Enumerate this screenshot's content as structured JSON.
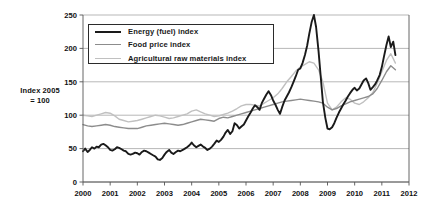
{
  "chart_data": {
    "type": "line",
    "title": "",
    "subtitle": "",
    "xlabel": "",
    "ylabel": "Index 2005 = 100",
    "ylabel_line1": "Index 2005",
    "ylabel_line2": "= 100",
    "xlim": [
      2000,
      2012
    ],
    "ylim": [
      0,
      250
    ],
    "yticks": [
      0,
      50,
      100,
      150,
      200,
      250
    ],
    "ytick_labels": [
      "0",
      "50",
      "100",
      "150",
      "200",
      "250"
    ],
    "xticks": [
      2000,
      2001,
      2002,
      2003,
      2004,
      2005,
      2006,
      2007,
      2008,
      2009,
      2010,
      2011,
      2012
    ],
    "xtick_labels": [
      "2000",
      "2001",
      "2002",
      "2003",
      "2004",
      "2005",
      "2006",
      "2007",
      "2008",
      "2009",
      "2010",
      "2011",
      "2012"
    ],
    "grid": "horizontal",
    "legend_position": "upper-left-inside",
    "colors": {
      "energy": "#1a1a1a",
      "food": "#8c8c8c",
      "agricultural": "#c0c0c0",
      "gridline": "#9a9a9a",
      "axis": "#555555",
      "background": "#ffffff"
    },
    "series": [
      {
        "name": "Energy (fuel) index",
        "color": "#1a1a1a",
        "width": 1.9,
        "x": [
          2000.0,
          2000.08,
          2000.17,
          2000.25,
          2000.33,
          2000.42,
          2000.5,
          2000.58,
          2000.67,
          2000.75,
          2000.83,
          2000.92,
          2001.0,
          2001.08,
          2001.17,
          2001.25,
          2001.33,
          2001.42,
          2001.5,
          2001.58,
          2001.67,
          2001.75,
          2001.83,
          2001.92,
          2002.0,
          2002.08,
          2002.17,
          2002.25,
          2002.33,
          2002.42,
          2002.5,
          2002.58,
          2002.67,
          2002.75,
          2002.83,
          2002.92,
          2003.0,
          2003.08,
          2003.17,
          2003.25,
          2003.33,
          2003.42,
          2003.5,
          2003.58,
          2003.67,
          2003.75,
          2003.83,
          2003.92,
          2004.0,
          2004.08,
          2004.17,
          2004.25,
          2004.33,
          2004.42,
          2004.5,
          2004.58,
          2004.67,
          2004.75,
          2004.83,
          2004.92,
          2005.0,
          2005.08,
          2005.17,
          2005.25,
          2005.33,
          2005.42,
          2005.5,
          2005.58,
          2005.67,
          2005.75,
          2005.83,
          2005.92,
          2006.0,
          2006.08,
          2006.17,
          2006.25,
          2006.33,
          2006.42,
          2006.5,
          2006.58,
          2006.67,
          2006.75,
          2006.83,
          2006.92,
          2007.0,
          2007.08,
          2007.17,
          2007.25,
          2007.33,
          2007.42,
          2007.5,
          2007.58,
          2007.67,
          2007.75,
          2007.83,
          2007.92,
          2008.0,
          2008.08,
          2008.17,
          2008.25,
          2008.33,
          2008.42,
          2008.5,
          2008.58,
          2008.67,
          2008.75,
          2008.83,
          2008.92,
          2009.0,
          2009.08,
          2009.17,
          2009.25,
          2009.33,
          2009.42,
          2009.5,
          2009.58,
          2009.67,
          2009.75,
          2009.83,
          2009.92,
          2010.0,
          2010.08,
          2010.17,
          2010.25,
          2010.33,
          2010.42,
          2010.5,
          2010.58,
          2010.67,
          2010.75,
          2010.83,
          2010.92,
          2011.0,
          2011.08,
          2011.17,
          2011.25,
          2011.33,
          2011.42,
          2011.5
        ],
        "values": [
          46,
          50,
          45,
          48,
          52,
          50,
          53,
          52,
          56,
          57,
          55,
          52,
          48,
          47,
          49,
          52,
          51,
          49,
          47,
          46,
          42,
          41,
          42,
          44,
          43,
          41,
          45,
          47,
          46,
          44,
          42,
          40,
          38,
          34,
          33,
          36,
          41,
          45,
          48,
          44,
          42,
          45,
          47,
          46,
          48,
          50,
          52,
          55,
          59,
          55,
          52,
          54,
          56,
          53,
          51,
          48,
          50,
          53,
          57,
          62,
          60,
          63,
          68,
          74,
          78,
          72,
          76,
          88,
          85,
          80,
          83,
          86,
          92,
          98,
          104,
          110,
          115,
          112,
          108,
          118,
          125,
          131,
          136,
          130,
          122,
          116,
          108,
          102,
          112,
          122,
          128,
          134,
          142,
          150,
          158,
          168,
          170,
          178,
          190,
          204,
          222,
          240,
          250,
          232,
          196,
          158,
          120,
          96,
          80,
          79,
          82,
          88,
          96,
          104,
          110,
          116,
          122,
          128,
          133,
          138,
          141,
          137,
          140,
          146,
          152,
          155,
          148,
          138,
          142,
          146,
          152,
          160,
          172,
          188,
          205,
          218,
          202,
          210,
          190
        ],
        "peak_value": 250,
        "peak_year": "mid-2008",
        "trough_value": 33,
        "trough_year": "late-2001",
        "end_value": 190
      },
      {
        "name": "Food price index",
        "color": "#8c8c8c",
        "width": 1.4,
        "x": [
          2000.0,
          2000.17,
          2000.33,
          2000.5,
          2000.67,
          2000.83,
          2001.0,
          2001.17,
          2001.33,
          2001.5,
          2001.67,
          2001.83,
          2002.0,
          2002.17,
          2002.33,
          2002.5,
          2002.67,
          2002.83,
          2003.0,
          2003.17,
          2003.33,
          2003.5,
          2003.67,
          2003.83,
          2004.0,
          2004.17,
          2004.33,
          2004.5,
          2004.67,
          2004.83,
          2005.0,
          2005.17,
          2005.33,
          2005.5,
          2005.67,
          2005.83,
          2006.0,
          2006.17,
          2006.33,
          2006.5,
          2006.67,
          2006.83,
          2007.0,
          2007.17,
          2007.33,
          2007.5,
          2007.67,
          2007.83,
          2008.0,
          2008.17,
          2008.33,
          2008.5,
          2008.67,
          2008.83,
          2009.0,
          2009.17,
          2009.33,
          2009.5,
          2009.67,
          2009.83,
          2010.0,
          2010.17,
          2010.33,
          2010.5,
          2010.67,
          2010.83,
          2011.0,
          2011.17,
          2011.33,
          2011.5
        ],
        "values": [
          86,
          84,
          83,
          84,
          85,
          86,
          85,
          83,
          82,
          81,
          80,
          80,
          80,
          82,
          84,
          85,
          86,
          87,
          88,
          87,
          86,
          85,
          86,
          88,
          90,
          92,
          94,
          93,
          92,
          91,
          95,
          97,
          96,
          98,
          100,
          102,
          104,
          106,
          108,
          110,
          112,
          114,
          116,
          118,
          120,
          121,
          122,
          123,
          124,
          123,
          122,
          121,
          120,
          118,
          112,
          108,
          110,
          114,
          117,
          120,
          122,
          124,
          126,
          128,
          132,
          140,
          152,
          165,
          174,
          168
        ],
        "peak_value": 174,
        "peak_year": "2011",
        "end_value": 168
      },
      {
        "name": "Agricultural raw materials index",
        "color": "#c0c0c0",
        "width": 1.4,
        "x": [
          2000.0,
          2000.17,
          2000.33,
          2000.5,
          2000.67,
          2000.83,
          2001.0,
          2001.17,
          2001.33,
          2001.5,
          2001.67,
          2001.83,
          2002.0,
          2002.17,
          2002.33,
          2002.5,
          2002.67,
          2002.83,
          2003.0,
          2003.17,
          2003.33,
          2003.5,
          2003.67,
          2003.83,
          2004.0,
          2004.17,
          2004.33,
          2004.5,
          2004.67,
          2004.83,
          2005.0,
          2005.17,
          2005.33,
          2005.5,
          2005.67,
          2005.83,
          2006.0,
          2006.17,
          2006.33,
          2006.5,
          2006.67,
          2006.83,
          2007.0,
          2007.17,
          2007.33,
          2007.5,
          2007.67,
          2007.83,
          2008.0,
          2008.17,
          2008.33,
          2008.5,
          2008.67,
          2008.83,
          2009.0,
          2009.17,
          2009.33,
          2009.5,
          2009.67,
          2009.83,
          2010.0,
          2010.17,
          2010.33,
          2010.5,
          2010.67,
          2010.83,
          2011.0,
          2011.17,
          2011.33,
          2011.5
        ],
        "values": [
          100,
          99,
          98,
          100,
          102,
          104,
          103,
          99,
          94,
          92,
          90,
          91,
          92,
          94,
          96,
          98,
          100,
          99,
          97,
          95,
          96,
          98,
          100,
          102,
          106,
          108,
          105,
          102,
          100,
          98,
          99,
          101,
          103,
          106,
          110,
          114,
          116,
          116,
          115,
          114,
          118,
          122,
          126,
          132,
          140,
          150,
          158,
          166,
          172,
          176,
          180,
          178,
          168,
          150,
          118,
          108,
          112,
          120,
          126,
          124,
          118,
          116,
          120,
          126,
          134,
          148,
          165,
          182,
          192,
          178
        ],
        "peak_value": 192,
        "peak_year": "2011",
        "end_value": 178
      }
    ]
  },
  "legend": {
    "items": [
      {
        "label": "Energy (fuel) index",
        "color": "#1a1a1a",
        "width": 2.6
      },
      {
        "label": "Food price index",
        "color": "#8c8c8c",
        "width": 1.6
      },
      {
        "label": "Agricultural raw materials index",
        "color": "#c0c0c0",
        "width": 1.6
      }
    ]
  }
}
